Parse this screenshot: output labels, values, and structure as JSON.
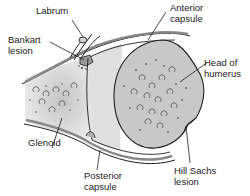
{
  "figure": {
    "colors": {
      "bone_fill": "#c8c8c8",
      "bone_light": "#e2e2e2",
      "outline": "#1e1e1e",
      "capsule": "#8a8a8a",
      "background": "#ffffff"
    },
    "labels": [
      {
        "id": "labrum",
        "text": "Labrum"
      },
      {
        "id": "bankart",
        "text": "Bankart\nlesion"
      },
      {
        "id": "anterior",
        "text": "Anterior\ncapsule"
      },
      {
        "id": "head",
        "text": "Head of\nhumerus"
      },
      {
        "id": "glenoid",
        "text": "Glenoid"
      },
      {
        "id": "posterior",
        "text": "Posterior\ncapsule"
      },
      {
        "id": "hillsachs",
        "text": "Hill Sachs\nlesion"
      }
    ]
  }
}
